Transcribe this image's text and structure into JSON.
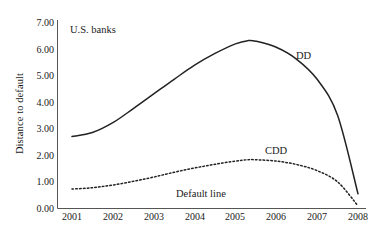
{
  "chart_data": {
    "type": "line",
    "title": "",
    "panel_label": "U.S. banks",
    "xlabel": "",
    "ylabel": "Distance to default",
    "xlim": [
      2001,
      2008
    ],
    "ylim": [
      0.0,
      7.0
    ],
    "grid": false,
    "legend_position": "inline-annotations",
    "x_tick_labels": [
      "2001",
      "2002",
      "2003",
      "2004",
      "2005",
      "2006",
      "2007",
      "2008"
    ],
    "y_tick_labels": [
      "0.00",
      "1.00",
      "2.00",
      "3.00",
      "4.00",
      "5.00",
      "6.00",
      "7.00"
    ],
    "y_ticks": [
      0.0,
      1.0,
      2.0,
      3.0,
      4.0,
      5.0,
      6.0,
      7.0
    ],
    "x": [
      2001.0,
      2001.5,
      2002.0,
      2002.5,
      2003.0,
      2003.5,
      2004.0,
      2004.5,
      2005.0,
      2005.3,
      2005.5,
      2006.0,
      2006.5,
      2007.0,
      2007.5,
      2008.0
    ],
    "series": [
      {
        "name": "DD",
        "label": "DD",
        "style": "solid",
        "color": "#222222",
        "values": [
          2.7,
          2.85,
          3.22,
          3.75,
          4.3,
          4.85,
          5.38,
          5.82,
          6.18,
          6.3,
          6.28,
          6.05,
          5.6,
          4.85,
          3.5,
          0.55
        ]
      },
      {
        "name": "CDD",
        "label": "CDD",
        "style": "dotted",
        "color": "#222222",
        "values": [
          0.73,
          0.78,
          0.88,
          1.02,
          1.18,
          1.36,
          1.52,
          1.66,
          1.78,
          1.83,
          1.83,
          1.78,
          1.65,
          1.42,
          1.0,
          0.1
        ]
      }
    ],
    "annotations": [
      {
        "text": "U.S. banks",
        "name": "panel-title"
      },
      {
        "text": "DD",
        "name": "series-label-dd"
      },
      {
        "text": "CDD",
        "name": "series-label-cdd"
      },
      {
        "text": "Default line",
        "name": "default-line-label"
      }
    ],
    "axis_color": "#555555"
  }
}
